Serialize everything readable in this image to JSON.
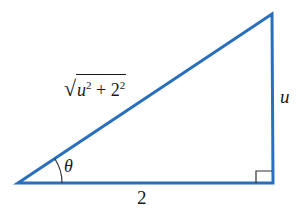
{
  "figure": {
    "type": "right-triangle",
    "line_color": "#2a6fbd",
    "marker_color": "#333333",
    "vertices": {
      "angle_vertex": [
        18,
        183
      ],
      "top_vertex": [
        272,
        14
      ],
      "right_angle_vertex": [
        273,
        183
      ]
    },
    "labels": {
      "hypotenuse": {
        "radical": "√",
        "term1_base": "u",
        "term1_exp": "2",
        "operator": " + ",
        "term2_base": "2",
        "term2_exp": "2"
      },
      "opposite": "u",
      "adjacent": "2",
      "angle": "θ"
    },
    "right_angle_marker": true
  }
}
